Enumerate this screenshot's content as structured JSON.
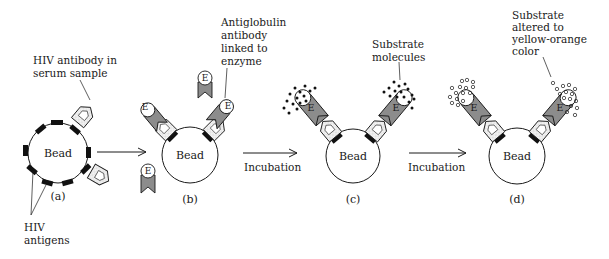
{
  "diagram": {
    "type": "ELISA process schematic",
    "colors": {
      "line": "#1a1a1a",
      "antigen": "#111111",
      "antiglobulin": "#8c8c8c",
      "antibody_fill": "#e6e6e6",
      "background": "#ffffff"
    },
    "bead_label": "Bead",
    "panels": [
      {
        "id": "a",
        "label": "(a)"
      },
      {
        "id": "b",
        "label": "(b)"
      },
      {
        "id": "c",
        "label": "(c)"
      },
      {
        "id": "d",
        "label": "(d)"
      }
    ],
    "arrows": [
      {
        "from": "a",
        "to": "b",
        "label": ""
      },
      {
        "from": "b",
        "to": "c",
        "label": "Incubation"
      },
      {
        "from": "c",
        "to": "d",
        "label": "Incubation"
      }
    ],
    "annotations": {
      "hiv_antibody": [
        "HIV antibody in",
        "serum sample"
      ],
      "hiv_antigens": [
        "HIV",
        "antigens"
      ],
      "antiglobulin": [
        "Antiglobulin",
        "antibody",
        "linked to",
        "enzyme"
      ],
      "substrate": [
        "Substrate",
        "molecules"
      ],
      "substrate_altered": [
        "Substrate",
        "altered to",
        "yellow-orange",
        "color"
      ]
    },
    "enzyme_symbol": "E"
  }
}
